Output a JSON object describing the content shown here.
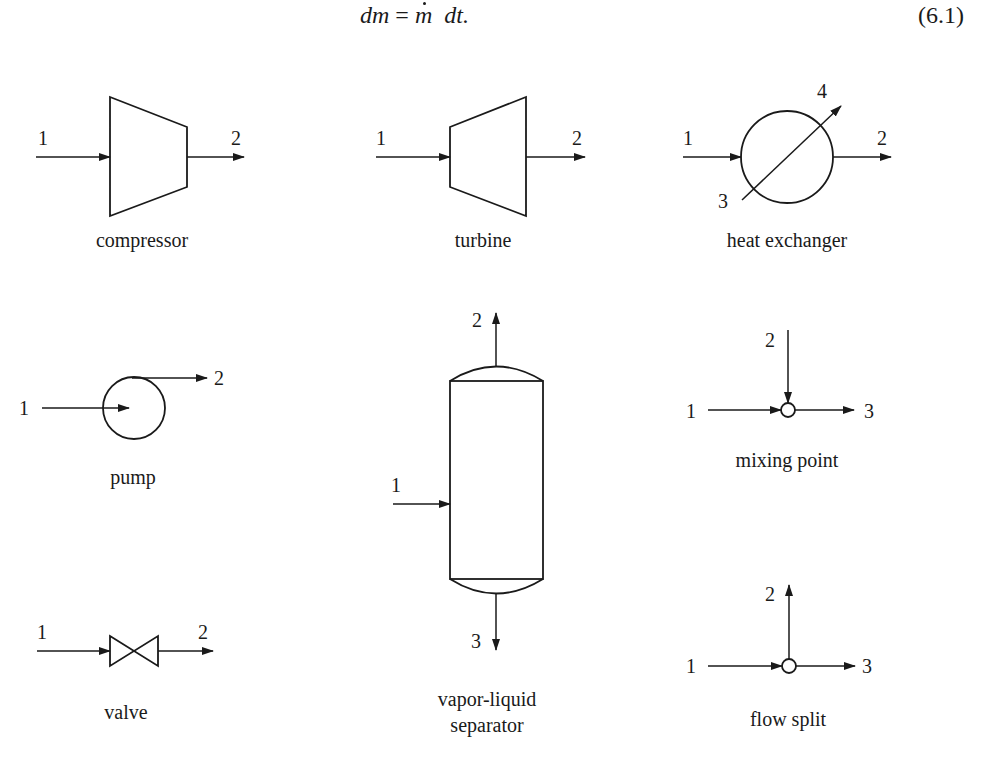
{
  "equation": {
    "lhs": "dm",
    "equals": "=",
    "mdot": "m",
    "rhs": "dt.",
    "number": "(6.1)"
  },
  "components": {
    "compressor": {
      "label": "compressor",
      "ports": {
        "in": "1",
        "out": "2"
      }
    },
    "turbine": {
      "label": "turbine",
      "ports": {
        "in": "1",
        "out": "2"
      }
    },
    "heat_exchanger": {
      "label": "heat exchanger",
      "ports": {
        "in": "1",
        "out": "2",
        "utility_in": "3",
        "utility_out": "4"
      }
    },
    "pump": {
      "label": "pump",
      "ports": {
        "in": "1",
        "out": "2"
      }
    },
    "separator": {
      "label_line1": "vapor-liquid",
      "label_line2": "separator",
      "ports": {
        "in": "1",
        "vapor_out": "2",
        "liquid_out": "3"
      }
    },
    "mixing_point": {
      "label": "mixing point",
      "ports": {
        "in1": "1",
        "in2": "2",
        "out": "3"
      }
    },
    "valve": {
      "label": "valve",
      "ports": {
        "in": "1",
        "out": "2"
      }
    },
    "flow_split": {
      "label": "flow split",
      "ports": {
        "in": "1",
        "out1": "2",
        "out2": "3"
      }
    }
  },
  "colors": {
    "ink": "#1a1a1a",
    "background": "#ffffff"
  }
}
